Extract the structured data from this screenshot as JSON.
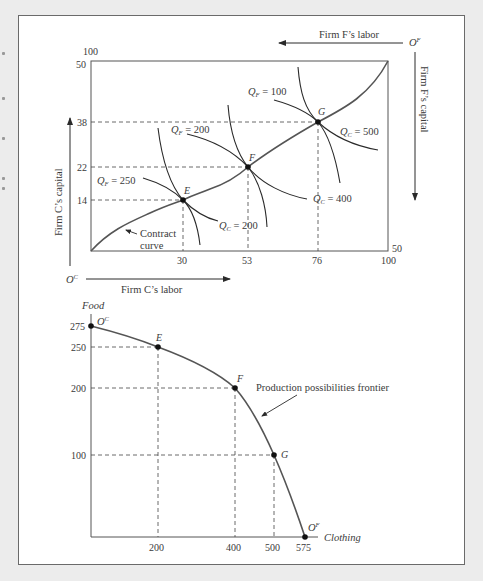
{
  "diagram": {
    "upper": {
      "title": "Edgeworth production box",
      "axes": {
        "c_labor_label": "Firm C’s labor",
        "c_capital_label": "Firm C’s capital",
        "f_labor_label": "Firm F’s labor",
        "f_capital_label": "Firm F’s capital",
        "origin_c": "O",
        "origin_c_sup": "C",
        "origin_f": "O",
        "origin_f_sup": "F"
      },
      "x_ticks": [
        "30",
        "53",
        "76",
        "100"
      ],
      "y_ticks": [
        "14",
        "22",
        "38",
        "50"
      ],
      "top_left_label": "100",
      "bottom_right_label": "50",
      "points": [
        {
          "name": "E",
          "labor": 30,
          "capital": 14
        },
        {
          "name": "F",
          "labor": 53,
          "capital": 22
        },
        {
          "name": "G",
          "labor": 76,
          "capital": 38
        }
      ],
      "isoquant_labels": {
        "qf250": {
          "q": "Q",
          "sub": "F",
          "val": " = 250"
        },
        "qf200": {
          "q": "Q",
          "sub": "F",
          "val": " = 200"
        },
        "qf100": {
          "q": "Q",
          "sub": "F",
          "val": " = 100"
        },
        "qc200": {
          "q": "Q",
          "sub": "C",
          "val": " = 200"
        },
        "qc400": {
          "q": "Q",
          "sub": "C",
          "val": " = 400"
        },
        "qc500": {
          "q": "Q",
          "sub": "C",
          "val": " = 500"
        }
      },
      "contract_curve_label_1": "Contract",
      "contract_curve_label_2": "curve"
    },
    "lower": {
      "y_axis_label": "Food",
      "x_axis_label": "Clothing",
      "x_ticks": [
        "200",
        "400",
        "500",
        "575"
      ],
      "y_ticks": [
        "275",
        "250",
        "200",
        "100"
      ],
      "origin_c": "O",
      "origin_c_sup": "C",
      "origin_f": "O",
      "origin_f_sup": "F",
      "points": [
        {
          "name": "O^C",
          "clothing": 0,
          "food": 275
        },
        {
          "name": "E",
          "clothing": 200,
          "food": 250
        },
        {
          "name": "F",
          "clothing": 400,
          "food": 200
        },
        {
          "name": "G",
          "clothing": 500,
          "food": 100
        },
        {
          "name": "O^F",
          "clothing": 575,
          "food": 0
        }
      ],
      "point_labels": [
        "E",
        "F",
        "G"
      ],
      "ppf_label": "Production possibilities frontier"
    }
  },
  "colors": {
    "background": "#ececec",
    "panel": "#ffffff",
    "line": "#2a2a2a",
    "curve": "#555555",
    "text": "#3a3a3a"
  }
}
